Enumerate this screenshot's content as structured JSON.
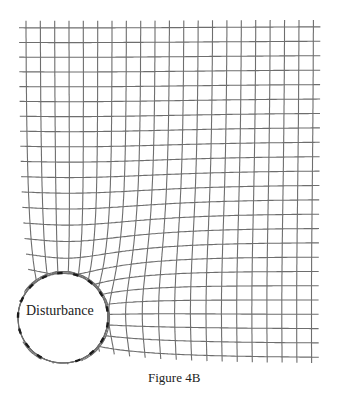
{
  "figure": {
    "caption": "Figure 4B",
    "disturbance_label": "Disturbance",
    "grid": {
      "origin_x": 25.7,
      "origin_y": 26.5,
      "spacing": 14.4,
      "columns": 21,
      "rows": 24,
      "overhang": 7,
      "line_color": "#6e6e6e",
      "line_width": 1.1
    },
    "disturbance": {
      "center_x": 63,
      "center_y": 318,
      "radius": 45,
      "dash_color": "#1a1a1a",
      "dash_count": 16
    }
  }
}
